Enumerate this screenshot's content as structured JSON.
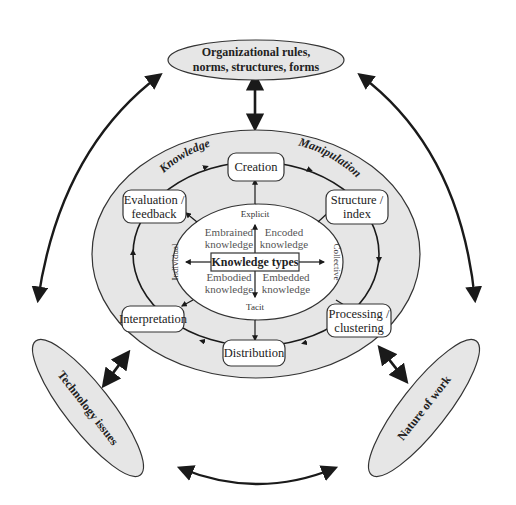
{
  "diagram": {
    "colors": {
      "ellipse_fill": "#e6e6e6",
      "stroke": "#333333",
      "arrow": "#1a1a1a",
      "box_fill": "#ffffff"
    },
    "external_factors": {
      "top": {
        "lines": [
          "Organizational rules,",
          "norms, structures, forms"
        ]
      },
      "left": {
        "label": "Technology issues"
      },
      "right": {
        "label": "Nature of work"
      }
    },
    "ring_labels": {
      "left": "Knowledge",
      "right": "Manipulation"
    },
    "cycle_steps": [
      {
        "id": "creation",
        "lines": [
          "Creation"
        ]
      },
      {
        "id": "structure",
        "lines": [
          "Structure /",
          "index"
        ]
      },
      {
        "id": "processing",
        "lines": [
          "Processing /",
          "clustering"
        ]
      },
      {
        "id": "distribution",
        "lines": [
          "Distribution"
        ]
      },
      {
        "id": "interpretation",
        "lines": [
          "Interpretation"
        ]
      },
      {
        "id": "evaluation",
        "lines": [
          "Evaluation /",
          "feedback"
        ]
      }
    ],
    "knowledge_types": {
      "center": "Knowledge types",
      "axes": {
        "top": "Explicit",
        "bottom": "Tacit",
        "left": "Individual",
        "right": "Collective"
      },
      "quadrants": {
        "top_left": [
          "Embrained",
          "knowledge"
        ],
        "top_right": [
          "Encoded",
          "knowledge"
        ],
        "bottom_left": [
          "Embodied",
          "knowledge"
        ],
        "bottom_right": [
          "Embedded",
          "knowledge"
        ]
      }
    }
  }
}
